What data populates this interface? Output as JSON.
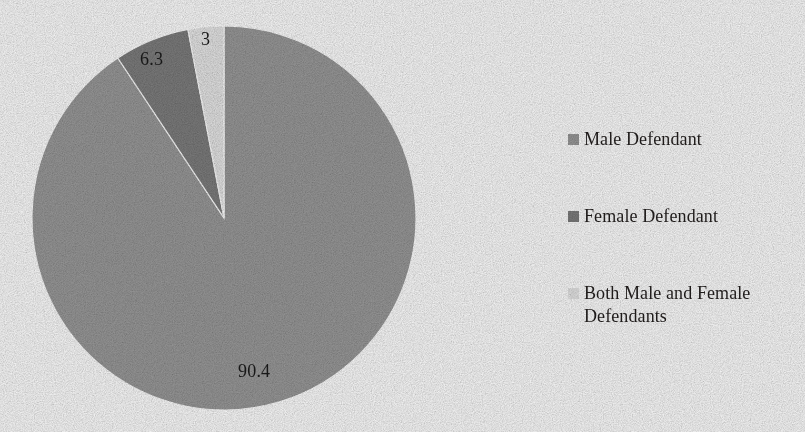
{
  "figure": {
    "title_remnant": "",
    "background_color": "#fefefe"
  },
  "chart_data": {
    "type": "pie",
    "title": "",
    "xlabel": "",
    "ylabel": "",
    "grid": false,
    "legend_position": "right",
    "start_angle_oclock": 12,
    "direction": "clockwise",
    "units": "percent",
    "categories": [
      "Male Defendant",
      "Female Defendant",
      "Both Male and Female Defendants"
    ],
    "values": [
      90.4,
      6.3,
      3
    ],
    "data_labels": [
      "90.4",
      "6.3",
      "3"
    ],
    "colors": [
      "#9a9a9a",
      "#7e7e7e",
      "#e7e7e7"
    ],
    "slices": [
      {
        "label": "Male Defendant",
        "value": 90.4,
        "data_label": "90.4",
        "color": "#9a9a9a"
      },
      {
        "label": "Female Defendant",
        "value": 6.3,
        "data_label": "6.3",
        "color": "#7e7e7e"
      },
      {
        "label": "Both Male and Female Defendants",
        "value": 3,
        "data_label": "3",
        "color": "#e7e7e7"
      }
    ]
  },
  "legend": {
    "items": [
      {
        "label": "Male Defendant",
        "color": "#9a9a9a"
      },
      {
        "label": "Female Defendant",
        "color": "#7e7e7e"
      },
      {
        "label": "Both Male and Female Defendants",
        "color": "#e7e7e7"
      }
    ]
  }
}
